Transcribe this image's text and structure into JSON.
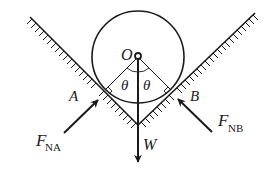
{
  "diagram": {
    "labels": {
      "center": "O",
      "contact_left": "A",
      "contact_right": "B",
      "angle_left": "θ",
      "angle_right": "θ",
      "weight": "W",
      "force_left_main": "F",
      "force_left_sub": "NA",
      "force_right_main": "F",
      "force_right_sub": "NB"
    },
    "colors": {
      "stroke": "#1a1a1a",
      "background": "#ffffff"
    }
  }
}
